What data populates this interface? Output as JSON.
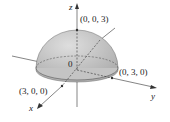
{
  "diagram": {
    "type": "3D hemisphere",
    "radius": 3,
    "axes": {
      "x": "x",
      "y": "y",
      "z": "z"
    },
    "origin_label": "0",
    "points": [
      {
        "label": "(0, 0, 3)"
      },
      {
        "label": "(0, 3, 0)"
      },
      {
        "label": "(3, 0, 0)"
      }
    ],
    "colors": {
      "surface": "#c9c9c9",
      "surface_shade": "#a8a8a8",
      "lines": "#333333"
    }
  }
}
